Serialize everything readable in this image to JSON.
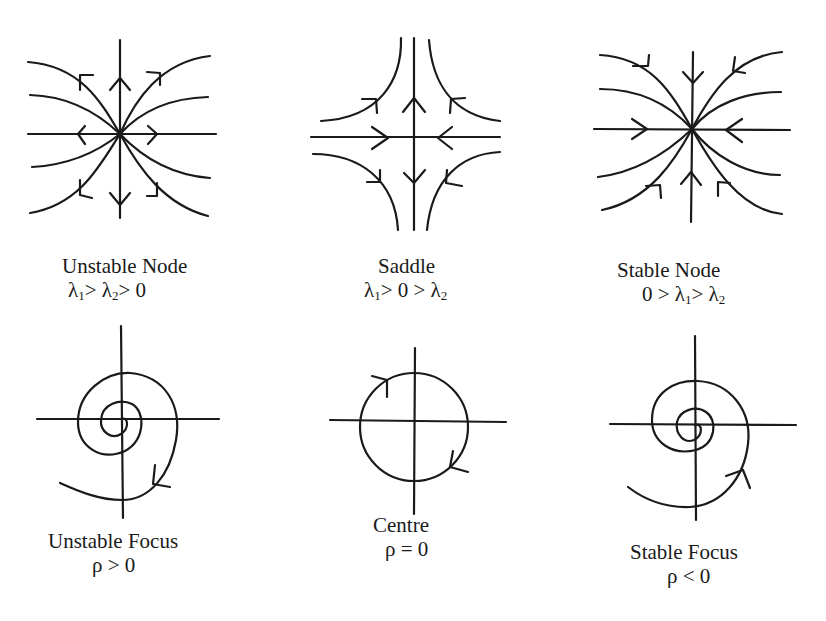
{
  "figure": {
    "panels": [
      {
        "id": "unstable-node",
        "name": "Unstable Node",
        "condition_parts": [
          "λ",
          "1",
          "> λ",
          "2",
          "> 0"
        ],
        "arrows": "outward"
      },
      {
        "id": "saddle",
        "name": "Saddle",
        "condition_parts": [
          "λ",
          "1",
          "> 0 > λ",
          "2",
          ""
        ],
        "arrows": "in along horizontal, out along vertical"
      },
      {
        "id": "stable-node",
        "name": "Stable Node",
        "condition_parts": [
          "0 > λ",
          "1",
          "> λ",
          "2",
          ""
        ],
        "arrows": "inward"
      },
      {
        "id": "unstable-focus",
        "name": "Unstable Focus",
        "condition": "ρ > 0",
        "arrows": "spiral outward"
      },
      {
        "id": "centre",
        "name": "Centre",
        "condition": "ρ = 0",
        "arrows": "closed orbit, clockwise"
      },
      {
        "id": "stable-focus",
        "name": "Stable Focus",
        "condition": "ρ < 0",
        "arrows": "spiral inward"
      }
    ]
  }
}
